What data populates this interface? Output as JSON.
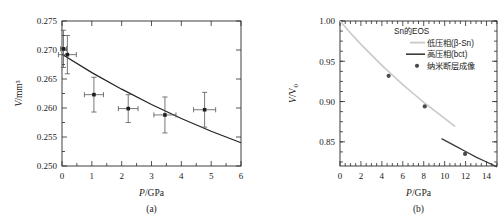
{
  "figure": {
    "panels": [
      {
        "id": "a",
        "caption": "(a)",
        "xlabel_italic": "P",
        "xlabel_rest": "/GPa",
        "ylabel_italic": "V",
        "ylabel_rest": "/mm³"
      },
      {
        "id": "b",
        "caption": "(b)",
        "xlabel_italic": "P",
        "xlabel_rest": "/GPa",
        "ylabel_italic": "V",
        "ylabel_rest": "/V",
        "ylabel_sub": "0"
      }
    ],
    "legend": {
      "title": "Sn的EOS",
      "items": [
        {
          "label": "低压相(β-Sn)",
          "marker": "line-light",
          "color": "#c9c9c9"
        },
        {
          "label": "高压相(bct)",
          "marker": "line-dark",
          "color": "#3a3a3a"
        },
        {
          "label": "纳米断层成像",
          "marker": "dot",
          "color": "#4a4a4a"
        }
      ]
    }
  },
  "chart_data": [
    {
      "type": "scatter",
      "panel": "a",
      "title": "",
      "xlabel": "P/GPa",
      "ylabel": "V/mm³",
      "xlim": [
        0,
        6
      ],
      "ylim": [
        0.25,
        0.275
      ],
      "xticks": [
        0,
        1,
        2,
        3,
        4,
        5,
        6
      ],
      "xtick_labels": [
        "0",
        "1",
        "2",
        "3",
        "4",
        "5",
        "6"
      ],
      "yticks": [
        0.25,
        0.255,
        0.26,
        0.265,
        0.27,
        0.275
      ],
      "ytick_labels": [
        "0.250",
        "0.255",
        "0.260",
        "0.265",
        "0.270",
        "0.275"
      ],
      "grid": false,
      "legend_position": "none",
      "series": [
        {
          "name": "纳米断层成像",
          "type": "scatter-errorbar",
          "x": [
            0.05,
            0.18,
            1.07,
            2.22,
            3.45,
            4.78
          ],
          "y": [
            0.2702,
            0.2692,
            0.2623,
            0.2599,
            0.2588,
            0.2597
          ],
          "xerr": [
            0.1,
            0.3,
            0.32,
            0.33,
            0.37,
            0.37
          ],
          "yerr": [
            0.0032,
            0.0033,
            0.003,
            0.0024,
            0.0031,
            0.003
          ]
        },
        {
          "name": "EOS fit",
          "type": "line",
          "x": [
            0.0,
            1.0,
            2.0,
            3.0,
            4.0,
            5.0,
            6.0
          ],
          "y": [
            0.26925,
            0.2661,
            0.26325,
            0.2606,
            0.2582,
            0.256,
            0.254
          ]
        }
      ]
    },
    {
      "type": "scatter",
      "panel": "b",
      "title": "",
      "xlabel": "P/GPa",
      "ylabel": "V/V0",
      "xlim": [
        0,
        15
      ],
      "ylim": [
        0.82,
        1.0
      ],
      "xticks": [
        0,
        2,
        4,
        6,
        8,
        10,
        12,
        14
      ],
      "xtick_labels": [
        "0",
        "2",
        "4",
        "6",
        "8",
        "10",
        "12",
        "14"
      ],
      "yticks": [
        0.85,
        0.9,
        0.95,
        1.0
      ],
      "ytick_labels": [
        "0.85",
        "0.90",
        "0.95",
        "1.00"
      ],
      "grid": false,
      "legend_position": "upper-right",
      "series": [
        {
          "name": "低压相(β-Sn)",
          "type": "line",
          "color": "#c9c9c9",
          "x": [
            0.0,
            1.0,
            2.0,
            3.0,
            4.0,
            5.0,
            6.0,
            7.0,
            8.0,
            9.0,
            10.0,
            11.0
          ],
          "y": [
            1.0,
            0.985,
            0.971,
            0.958,
            0.945,
            0.933,
            0.921,
            0.91,
            0.899,
            0.889,
            0.879,
            0.869
          ]
        },
        {
          "name": "高压相(bct)",
          "type": "line",
          "color": "#3a3a3a",
          "x": [
            9.7,
            11.0,
            12.0,
            13.0,
            14.0,
            15.0
          ],
          "y": [
            0.854,
            0.845,
            0.838,
            0.831,
            0.825,
            0.819
          ]
        },
        {
          "name": "纳米断层成像",
          "type": "scatter",
          "color": "#4a4a4a",
          "x": [
            4.65,
            8.1,
            11.95
          ],
          "y": [
            0.932,
            0.894,
            0.835
          ]
        }
      ]
    }
  ]
}
